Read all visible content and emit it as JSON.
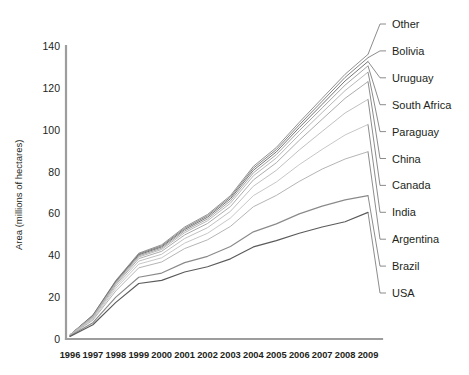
{
  "chart_data": {
    "type": "line",
    "title": "",
    "xlabel": "",
    "ylabel": "Area (millions of hectares)",
    "categories": [
      "1996",
      "1997",
      "1998",
      "1999",
      "2000",
      "2001",
      "2002",
      "2003",
      "2004",
      "2005",
      "2006",
      "2007",
      "2008",
      "2009"
    ],
    "x": [
      1996,
      1997,
      1998,
      1999,
      2000,
      2001,
      2002,
      2003,
      2004,
      2005,
      2006,
      2007,
      2008,
      2009
    ],
    "ylim": [
      0,
      145
    ],
    "yticks": [
      0,
      20,
      40,
      60,
      80,
      100,
      120,
      140
    ],
    "xlim": [
      1996,
      2009
    ],
    "grid": false,
    "legend_position": "right-leader-lines",
    "series": [
      {
        "name": "Other",
        "color": "#8c8c8c",
        "values": [
          2.0,
          11.5,
          28.0,
          41.0,
          45.0,
          53.5,
          59.5,
          68.5,
          82.5,
          91.5,
          103.5,
          115.0,
          126.5,
          136.0
        ]
      },
      {
        "name": "Bolivia",
        "color": "#7d7d7d",
        "values": [
          2.0,
          11.3,
          27.7,
          40.6,
          44.5,
          52.9,
          58.9,
          67.8,
          81.6,
          90.5,
          102.3,
          113.6,
          125.0,
          134.4
        ]
      },
      {
        "name": "Uruguay",
        "color": "#6e6e6e",
        "values": [
          2.0,
          11.1,
          27.4,
          40.2,
          44.0,
          52.3,
          58.2,
          67.0,
          80.6,
          89.4,
          101.0,
          112.1,
          123.3,
          132.6
        ]
      },
      {
        "name": "South Africa",
        "color": "#a0a0a0",
        "values": [
          2.0,
          10.9,
          27.0,
          39.7,
          43.4,
          51.6,
          57.4,
          66.0,
          79.4,
          88.1,
          99.5,
          110.4,
          121.3,
          130.5
        ]
      },
      {
        "name": "Paraguay",
        "color": "#b4b4b4",
        "values": [
          2.0,
          10.7,
          26.6,
          39.2,
          42.8,
          50.8,
          56.5,
          64.9,
          78.0,
          86.5,
          97.6,
          108.2,
          118.7,
          127.5
        ]
      },
      {
        "name": "China",
        "color": "#a8a8a8",
        "values": [
          1.9,
          10.4,
          26.0,
          38.4,
          41.9,
          49.7,
          55.2,
          63.3,
          76.0,
          84.2,
          94.9,
          105.0,
          115.0,
          123.0
        ]
      },
      {
        "name": "Canada",
        "color": "#bdbdbd",
        "values": [
          1.8,
          10.0,
          25.2,
          37.2,
          40.5,
          48.0,
          53.2,
          61.0,
          73.0,
          80.6,
          90.3,
          99.2,
          108.0,
          114.5
        ]
      },
      {
        "name": "India",
        "color": "#c4c4c4",
        "values": [
          1.7,
          9.5,
          24.2,
          35.8,
          38.8,
          45.8,
          50.5,
          57.8,
          68.5,
          75.0,
          83.3,
          90.6,
          97.5,
          102.5
        ]
      },
      {
        "name": "Argentina",
        "color": "#b0b0b0",
        "values": [
          1.6,
          9.0,
          23.0,
          34.0,
          36.8,
          43.2,
          47.4,
          53.8,
          63.2,
          68.6,
          75.3,
          81.2,
          86.0,
          89.5
        ]
      },
      {
        "name": "Brazil",
        "color": "#8a8a8a",
        "values": [
          1.4,
          7.8,
          20.0,
          29.5,
          31.5,
          36.5,
          39.5,
          44.2,
          51.2,
          55.0,
          59.8,
          63.5,
          66.5,
          68.5
        ]
      },
      {
        "name": "USA",
        "color": "#5a5a5a",
        "values": [
          1.2,
          6.8,
          17.5,
          26.5,
          28.0,
          32.0,
          34.5,
          38.3,
          44.0,
          47.0,
          50.5,
          53.5,
          56.0,
          60.5
        ]
      }
    ]
  },
  "axes": {
    "y_label": "Area (millions of hectares)",
    "y_ticks": [
      "0",
      "20",
      "40",
      "60",
      "80",
      "100",
      "120",
      "140"
    ],
    "x_ticks": [
      "1996",
      "1997",
      "1998",
      "1999",
      "2000",
      "2001",
      "2002",
      "2003",
      "2004",
      "2005",
      "2006",
      "2007",
      "2008",
      "2009"
    ]
  },
  "legend": {
    "items": [
      {
        "label": "Other"
      },
      {
        "label": "Bolivia"
      },
      {
        "label": "Uruguay"
      },
      {
        "label": "South Africa"
      },
      {
        "label": "Paraguay"
      },
      {
        "label": "China"
      },
      {
        "label": "Canada"
      },
      {
        "label": "India"
      },
      {
        "label": "Argentina"
      },
      {
        "label": "Brazil"
      },
      {
        "label": "USA"
      }
    ]
  },
  "colors": {
    "axis": "#9d9d9d",
    "text": "#231f20",
    "background": "#ffffff"
  }
}
